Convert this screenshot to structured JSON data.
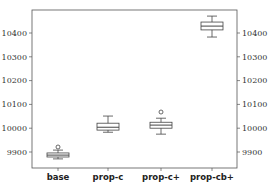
{
  "chart_data": {
    "type": "boxplot",
    "title": "",
    "xlabel": "",
    "ylabel": "",
    "ylim": [
      9835,
      10500
    ],
    "yticks": [
      9900,
      10000,
      10100,
      10200,
      10300,
      10400
    ],
    "ytick_labels": [
      "9900",
      "10000",
      "10100",
      "10200",
      "10300",
      "10400"
    ],
    "ytick_labels_right": [
      "9900",
      "10000",
      "10100",
      "10200",
      "10300",
      "10400"
    ],
    "grid": false,
    "categories": [
      "base",
      "prop-c",
      "prop-c+",
      "prop-cb+"
    ],
    "boxes": [
      {
        "name": "base",
        "whislo": 9871,
        "q1": 9879,
        "med": 9887,
        "q3": 9896,
        "whishi": 9908,
        "fliers": [
          9921
        ]
      },
      {
        "name": "prop-c",
        "whislo": 9983,
        "q1": 9992,
        "med": 10004,
        "q3": 10021,
        "whishi": 10051,
        "fliers": []
      },
      {
        "name": "prop-c+",
        "whislo": 9975,
        "q1": 10000,
        "med": 10013,
        "q3": 10025,
        "whishi": 10042,
        "fliers": [
          10068
        ]
      },
      {
        "name": "prop-cb+",
        "whislo": 10383,
        "q1": 10413,
        "med": 10429,
        "q3": 10446,
        "whishi": 10471,
        "fliers": []
      }
    ]
  }
}
